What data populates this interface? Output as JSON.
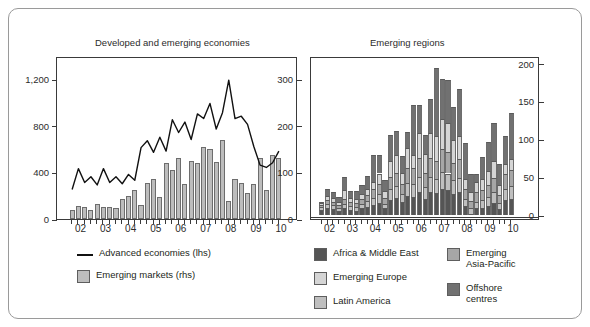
{
  "figure": {
    "left_panel_title": "Developed and emerging economies",
    "right_panel_title": "Emerging regions"
  },
  "legend": {
    "left": [
      {
        "label": "Advanced economies (lhs)",
        "marker": "line",
        "color": "#111111"
      },
      {
        "label": "Emerging markets (rhs)",
        "marker": "swatch",
        "color": "#bdbdbd"
      }
    ],
    "right": [
      {
        "label": "Africa & Middle East",
        "marker": "swatch",
        "color": "#555555"
      },
      {
        "label": "Emerging Europe",
        "marker": "swatch",
        "color": "#d5d5d5"
      },
      {
        "label": "Latin America",
        "marker": "swatch",
        "color": "#bfbfbf"
      },
      {
        "label": "Emerging\nAsia-Pacific",
        "marker": "swatch",
        "color": "#a6a6a6"
      },
      {
        "label": "Offshore\ncentres",
        "marker": "swatch",
        "color": "#717171"
      }
    ]
  },
  "chart_data": [
    {
      "type": "bar",
      "title": "Developed and emerging economies",
      "xlabel": "",
      "ylabel": "",
      "grid": false,
      "legend_position": "below",
      "x": [
        "02",
        "02",
        "02",
        "02",
        "03",
        "03",
        "03",
        "03",
        "04",
        "04",
        "04",
        "04",
        "05",
        "05",
        "05",
        "05",
        "06",
        "06",
        "06",
        "06",
        "07",
        "07",
        "07",
        "07",
        "08",
        "08",
        "08",
        "08",
        "09",
        "09",
        "09",
        "09",
        "10",
        "10"
      ],
      "categories": [
        "02",
        "03",
        "04",
        "05",
        "06",
        "07",
        "08",
        "09",
        "10"
      ],
      "y_left": {
        "label": "Advanced economies (lhs)",
        "ticks": [
          0,
          400,
          800,
          1200
        ],
        "tick_labels": [
          "0",
          "400",
          "800",
          "1,200"
        ],
        "ylim": [
          0,
          1400
        ]
      },
      "y_right": {
        "label": "Emerging markets (rhs)",
        "ticks": [
          0,
          100,
          200,
          300
        ],
        "tick_labels": [
          "0",
          "100",
          "200",
          "300"
        ],
        "ylim": [
          0,
          350
        ]
      },
      "series": [
        {
          "name": "Advanced economies (lhs)",
          "plot": "line",
          "axis": "left",
          "color": "#111111",
          "values": [
            270,
            450,
            330,
            380,
            310,
            450,
            330,
            380,
            320,
            400,
            350,
            630,
            690,
            590,
            720,
            600,
            870,
            760,
            850,
            700,
            920,
            880,
            1010,
            790,
            930,
            1210,
            880,
            900,
            830,
            640,
            480,
            460,
            500,
            600
          ]
        },
        {
          "name": "Emerging markets (rhs)",
          "plot": "bar",
          "axis": "right",
          "color": "#bdbdbd",
          "values": [
            20,
            27,
            25,
            19,
            33,
            26,
            26,
            23,
            43,
            50,
            62,
            30,
            78,
            85,
            48,
            120,
            105,
            130,
            76,
            125,
            120,
            155,
            150,
            122,
            170,
            38,
            85,
            78,
            55,
            75,
            130,
            62,
            138,
            130
          ]
        }
      ]
    },
    {
      "type": "bar",
      "title": "Emerging regions",
      "subtype": "stacked",
      "xlabel": "",
      "ylabel": "",
      "grid": false,
      "legend_position": "below",
      "x": [
        "02",
        "02",
        "02",
        "02",
        "03",
        "03",
        "03",
        "03",
        "04",
        "04",
        "04",
        "04",
        "05",
        "05",
        "05",
        "05",
        "06",
        "06",
        "06",
        "06",
        "07",
        "07",
        "07",
        "07",
        "08",
        "08",
        "08",
        "08",
        "09",
        "09",
        "09",
        "09",
        "10",
        "10"
      ],
      "categories": [
        "02",
        "03",
        "04",
        "05",
        "06",
        "07",
        "08",
        "09",
        "10"
      ],
      "y_axis": {
        "ticks": [
          0,
          50,
          100,
          150,
          200
        ],
        "tick_labels": [
          "0",
          "50",
          "100",
          "150",
          "200"
        ],
        "ylim": [
          -5,
          210
        ],
        "position": "right"
      },
      "series": [
        {
          "name": "Africa & Middle East",
          "color": "#555555",
          "stack_order": 1,
          "values": [
            7,
            9,
            8,
            6,
            9,
            7,
            6,
            9,
            11,
            13,
            16,
            9,
            20,
            23,
            17,
            25,
            24,
            30,
            22,
            30,
            29,
            35,
            33,
            28,
            30,
            12,
            2,
            9,
            10,
            12,
            16,
            8,
            20,
            22
          ]
        },
        {
          "name": "Latin America",
          "color": "#bfbfbf",
          "stack_order": 2,
          "values": [
            4,
            6,
            5,
            4,
            6,
            5,
            5,
            6,
            8,
            10,
            12,
            6,
            14,
            15,
            11,
            17,
            17,
            20,
            15,
            20,
            19,
            22,
            22,
            18,
            19,
            9,
            7,
            9,
            10,
            12,
            14,
            8,
            15,
            16
          ]
        },
        {
          "name": "Emerging Asia-Pacific",
          "color": "#a6a6a6",
          "stack_order": 3,
          "values": [
            3,
            5,
            5,
            4,
            6,
            5,
            5,
            6,
            8,
            11,
            13,
            8,
            16,
            18,
            13,
            20,
            21,
            25,
            19,
            25,
            24,
            30,
            28,
            23,
            25,
            13,
            10,
            12,
            13,
            16,
            19,
            11,
            20,
            22
          ]
        },
        {
          "name": "Emerging Europe",
          "color": "#d5d5d5",
          "stack_order": 4,
          "values": [
            2,
            5,
            5,
            4,
            12,
            6,
            5,
            7,
            8,
            10,
            14,
            9,
            22,
            24,
            15,
            27,
            17,
            33,
            25,
            33,
            32,
            40,
            38,
            30,
            30,
            14,
            12,
            14,
            15,
            18,
            22,
            13,
            12,
            14
          ]
        },
        {
          "name": "Offshore centres",
          "color": "#717171",
          "stack_order": 5,
          "values": [
            2,
            9,
            8,
            6,
            17,
            9,
            11,
            12,
            17,
            36,
            25,
            14,
            34,
            31,
            22,
            21,
            67,
            37,
            25,
            45,
            90,
            53,
            58,
            44,
            62,
            47,
            23,
            11,
            29,
            38,
            50,
            27,
            38,
            61
          ]
        }
      ]
    }
  ]
}
